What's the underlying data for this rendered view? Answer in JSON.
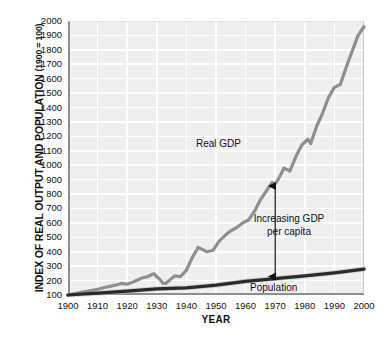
{
  "chart_data": {
    "type": "line",
    "title": "",
    "xlabel": "YEAR",
    "ylabel": "INDEX OF REAL OUTPUT AND POPULATION",
    "ylabel_note": "(1900 = 100)",
    "xlim": [
      1900,
      2000
    ],
    "ylim": [
      100,
      2000
    ],
    "grid": true,
    "legend": "inline-annotations",
    "xticks": [
      "1900",
      "1910",
      "1920",
      "1930",
      "1940",
      "1950",
      "1960",
      "1970",
      "1980",
      "1990",
      "2000"
    ],
    "yticks": [
      "100",
      "200",
      "300",
      "400",
      "500",
      "600",
      "700",
      "800",
      "900",
      "1000",
      "1100",
      "1200",
      "1300",
      "1400",
      "1500",
      "1600",
      "1700",
      "1800",
      "1900",
      "2000"
    ],
    "series": [
      {
        "name": "Real GDP",
        "color": "#8f8f8f",
        "x": [
          1900,
          1905,
          1910,
          1913,
          1916,
          1918,
          1920,
          1922,
          1925,
          1927,
          1929,
          1930,
          1931,
          1932,
          1933,
          1934,
          1936,
          1938,
          1940,
          1942,
          1944,
          1945,
          1947,
          1949,
          1951,
          1953,
          1955,
          1957,
          1959,
          1961,
          1963,
          1965,
          1967,
          1969,
          1970,
          1971,
          1973,
          1975,
          1977,
          1979,
          1981,
          1982,
          1984,
          1986,
          1988,
          1990,
          1992,
          1994,
          1996,
          1998,
          2000
        ],
        "y": [
          100,
          120,
          140,
          155,
          168,
          180,
          175,
          190,
          218,
          228,
          248,
          226,
          210,
          182,
          180,
          198,
          232,
          228,
          272,
          360,
          430,
          420,
          400,
          410,
          472,
          512,
          545,
          568,
          600,
          620,
          680,
          760,
          820,
          880,
          870,
          900,
          980,
          960,
          1060,
          1140,
          1180,
          1150,
          1270,
          1360,
          1470,
          1540,
          1560,
          1680,
          1790,
          1900,
          1960
        ]
      },
      {
        "name": "Population",
        "color": "#2a2a2a",
        "x": [
          1900,
          1910,
          1920,
          1930,
          1940,
          1950,
          1960,
          1970,
          1980,
          1990,
          2000
        ],
        "y": [
          100,
          113,
          127,
          143,
          150,
          168,
          195,
          214,
          232,
          254,
          280
        ]
      }
    ],
    "annotations": [
      {
        "name": "real-gdp-label",
        "text": "Real GDP",
        "x": 1963,
        "y": 1130
      },
      {
        "name": "population-label",
        "text": "Population",
        "x": 1982,
        "y": 160
      },
      {
        "name": "increasing-gdp-per-capita-label",
        "text": "Increasing GDP per capita",
        "x": 1982,
        "y": 560
      },
      {
        "name": "gdp-per-capita-arrow",
        "text": "",
        "from_year": 1970,
        "from_value": 214,
        "to_value": 870
      }
    ]
  },
  "axis": {
    "y_title_main": "INDEX OF REAL OUTPUT AND POPULATION",
    "y_title_sub": "(1900 = 100)",
    "x_title": "YEAR"
  },
  "annotations": {
    "real_gdp": "Real GDP",
    "population": "Population",
    "increasing_gdp_per_capita": "Increasing GDP per capita"
  },
  "colors": {
    "plot_background": "#efefef",
    "gridline": "#ffffff",
    "axis": "#8e8e8e",
    "gdp_line": "#8f8f8f",
    "population_line": "#2a2a2a",
    "text": "#111111"
  }
}
